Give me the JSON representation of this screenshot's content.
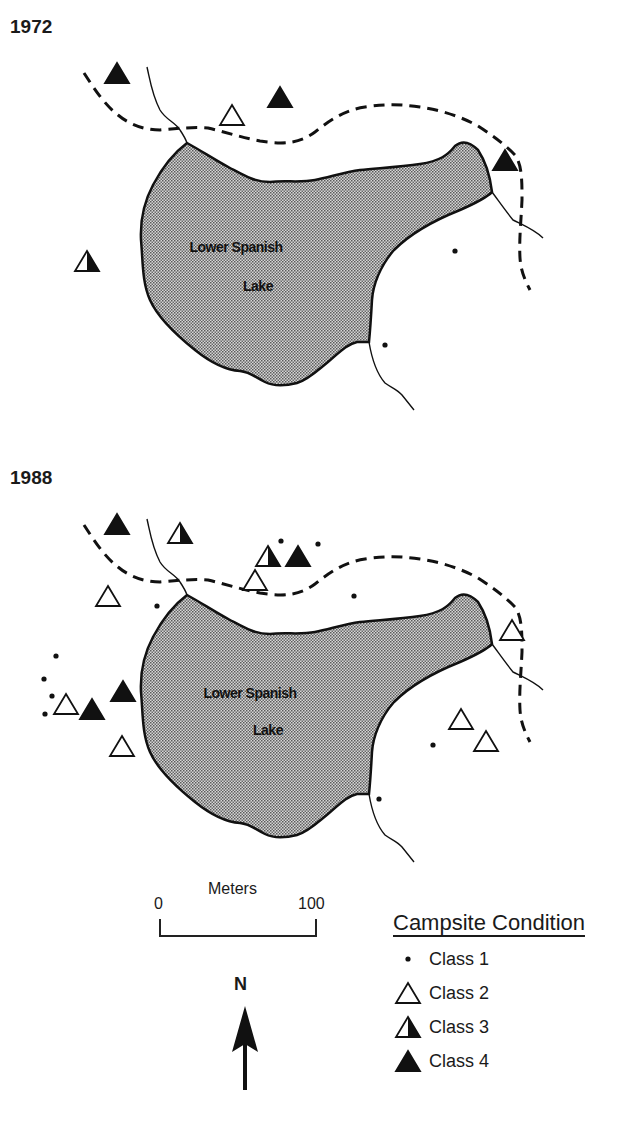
{
  "maps": [
    {
      "year": "1972",
      "lake_label_line1": "Lower Spanish",
      "lake_label_line2": "Lake",
      "campsites": [
        {
          "class": 4,
          "x": 117,
          "y": 73
        },
        {
          "class": 2,
          "x": 232,
          "y": 115
        },
        {
          "class": 4,
          "x": 280,
          "y": 97
        },
        {
          "class": 4,
          "x": 505,
          "y": 160
        },
        {
          "class": 3,
          "x": 87,
          "y": 261
        },
        {
          "class": 1,
          "x": 455,
          "y": 251
        },
        {
          "class": 1,
          "x": 385,
          "y": 345
        }
      ]
    },
    {
      "year": "1988",
      "lake_label_line1": "Lower Spanish",
      "lake_label_line2": "Lake",
      "campsites": [
        {
          "class": 4,
          "x": 117,
          "y": 524
        },
        {
          "class": 3,
          "x": 180,
          "y": 533
        },
        {
          "class": 3,
          "x": 268,
          "y": 556
        },
        {
          "class": 4,
          "x": 298,
          "y": 556
        },
        {
          "class": 1,
          "x": 281,
          "y": 541
        },
        {
          "class": 1,
          "x": 318,
          "y": 544
        },
        {
          "class": 2,
          "x": 255,
          "y": 580
        },
        {
          "class": 1,
          "x": 354,
          "y": 596
        },
        {
          "class": 2,
          "x": 108,
          "y": 596
        },
        {
          "class": 1,
          "x": 157,
          "y": 606
        },
        {
          "class": 2,
          "x": 512,
          "y": 630
        },
        {
          "class": 1,
          "x": 56,
          "y": 656
        },
        {
          "class": 1,
          "x": 44,
          "y": 679
        },
        {
          "class": 1,
          "x": 52,
          "y": 696
        },
        {
          "class": 1,
          "x": 45,
          "y": 714
        },
        {
          "class": 2,
          "x": 66,
          "y": 704
        },
        {
          "class": 4,
          "x": 92,
          "y": 709
        },
        {
          "class": 4,
          "x": 123,
          "y": 691
        },
        {
          "class": 2,
          "x": 122,
          "y": 746
        },
        {
          "class": 2,
          "x": 461,
          "y": 719
        },
        {
          "class": 2,
          "x": 486,
          "y": 741
        },
        {
          "class": 1,
          "x": 433,
          "y": 745
        },
        {
          "class": 1,
          "x": 379,
          "y": 799
        }
      ]
    }
  ],
  "scale": {
    "title": "Meters",
    "min_label": "0",
    "max_label": "100"
  },
  "north_arrow": {
    "label": "N"
  },
  "legend": {
    "title": "Campsite Condition",
    "items": [
      {
        "symbol": "dot",
        "label": "Class 1"
      },
      {
        "symbol": "open-triangle",
        "label": "Class 2"
      },
      {
        "symbol": "half-filled-triangle",
        "label": "Class 3"
      },
      {
        "symbol": "filled-triangle",
        "label": "Class 4"
      }
    ]
  },
  "colors": {
    "lake_fill": "#b8b8b8",
    "ink": "#111111",
    "background": "#ffffff"
  }
}
